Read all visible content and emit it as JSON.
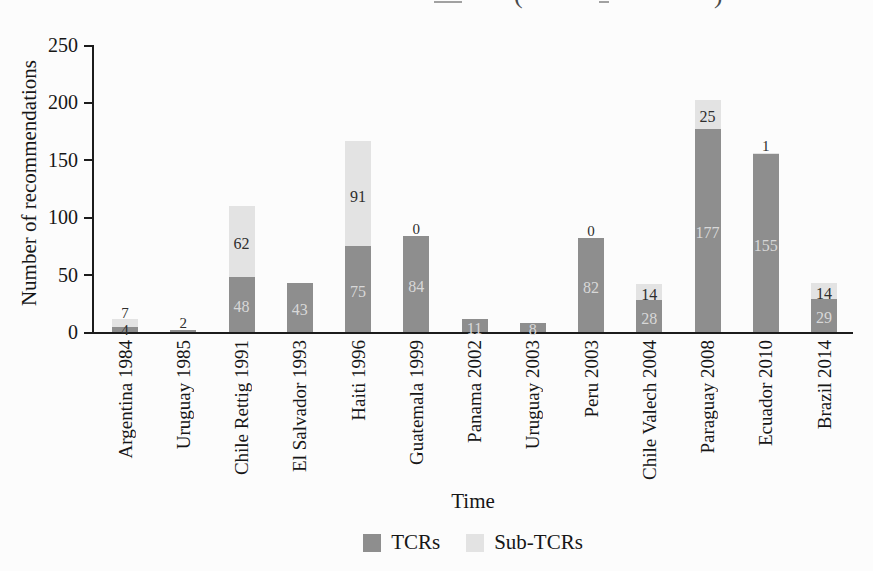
{
  "figure": {
    "cropped_title": {
      "paren_open_x": 514,
      "paren_close_x": 714,
      "marks": [
        {
          "x": 434,
          "w": 28
        },
        {
          "x": 599,
          "w": 10
        }
      ]
    }
  },
  "chart_data": {
    "type": "bar",
    "stacked": true,
    "categories": [
      "Argentina 1984",
      "Uruguay 1985",
      "Chile Rettig 1991",
      "El Salvador 1993",
      "Haiti 1996",
      "Guatemala 1999",
      "Panama 2002",
      "Uruguay 2003",
      "Peru 2003",
      "Chile Valech 2004",
      "Paraguay 2008",
      "Ecuador 2010",
      "Brazil 2014"
    ],
    "series": [
      {
        "name": "TCRs",
        "color": "#8e8e8e",
        "values": [
          4,
          2,
          48,
          43,
          75,
          84,
          11,
          8,
          82,
          28,
          177,
          155,
          29
        ]
      },
      {
        "name": "Sub-TCRs",
        "color": "#e3e3e3",
        "values": [
          7,
          0,
          62,
          0,
          91,
          0,
          0,
          0,
          0,
          14,
          25,
          1,
          14
        ]
      }
    ],
    "totals": [
      11,
      2,
      110,
      43,
      166,
      84,
      11,
      8,
      82,
      42,
      202,
      156,
      43
    ],
    "bar_value_labels": [
      {
        "tcr": "4",
        "tcr_pos": "baseline",
        "sub": "7",
        "sub_pos": "above"
      },
      {
        "tcr": "2",
        "tcr_pos": "above",
        "sub": null,
        "sub_pos": null
      },
      {
        "tcr": "48",
        "tcr_pos": "inside",
        "sub": "62",
        "sub_pos": "inside"
      },
      {
        "tcr": "43",
        "tcr_pos": "inside",
        "sub": null,
        "sub_pos": null
      },
      {
        "tcr": "75",
        "tcr_pos": "inside",
        "sub": "91",
        "sub_pos": "inside"
      },
      {
        "tcr": "84",
        "tcr_pos": "inside",
        "sub": "0",
        "sub_pos": "above"
      },
      {
        "tcr": "11",
        "tcr_pos": "inside",
        "sub": null,
        "sub_pos": null
      },
      {
        "tcr": "8",
        "tcr_pos": "inside",
        "sub": null,
        "sub_pos": null
      },
      {
        "tcr": "82",
        "tcr_pos": "inside",
        "sub": "0",
        "sub_pos": "above"
      },
      {
        "tcr": "28",
        "tcr_pos": "inside",
        "sub": "14",
        "sub_pos": "inside"
      },
      {
        "tcr": "177",
        "tcr_pos": "inside",
        "sub": "25",
        "sub_pos": "inside"
      },
      {
        "tcr": "155",
        "tcr_pos": "inside",
        "sub": "1",
        "sub_pos": "above"
      },
      {
        "tcr": "29",
        "tcr_pos": "inside",
        "sub": "14",
        "sub_pos": "inside"
      }
    ],
    "xlabel": "Time",
    "ylabel": "Number of recommendations",
    "ylim": [
      0,
      250
    ],
    "yticks": [
      0,
      50,
      100,
      150,
      200,
      250
    ],
    "grid": false,
    "legend_position": "bottom-center"
  },
  "colors": {
    "tcr_bar": "#8e8e8e",
    "sub_bar": "#e3e3e3",
    "axis": "#1c1c1c",
    "label_on_dark": "#d8d8d8",
    "label_dark": "#2e2e2e",
    "background": "#fcfcfc"
  }
}
